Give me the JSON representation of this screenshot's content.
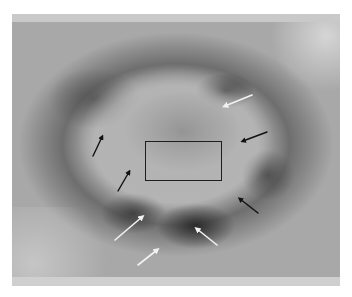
{
  "figure": {
    "type": "grayscale dermoscopic lesion image",
    "colors": {
      "background": "#ffffff",
      "lesion_ring": "#6e6e6e",
      "center": "#b4b4b4",
      "white_arrow": "#f2f2f2",
      "black_arrow": "#111111",
      "box": "#1e1e1e"
    },
    "annotations": {
      "rectangle": {
        "x": 145,
        "y": 141,
        "width": 77,
        "height": 40
      },
      "white_arrows": [
        {
          "from": [
            252,
            95
          ],
          "to": [
            225,
            106
          ]
        },
        {
          "from": [
            115,
            240
          ],
          "to": [
            142,
            217
          ]
        },
        {
          "from": [
            217,
            245
          ],
          "to": [
            197,
            229
          ]
        },
        {
          "from": [
            138,
            265
          ],
          "to": [
            157,
            250
          ]
        }
      ],
      "black_arrows": [
        {
          "from": [
            267,
            132
          ],
          "to": [
            243,
            141
          ]
        },
        {
          "from": [
            93,
            156
          ],
          "to": [
            102,
            137
          ]
        },
        {
          "from": [
            118,
            191
          ],
          "to": [
            129,
            172
          ]
        },
        {
          "from": [
            258,
            213
          ],
          "to": [
            240,
            199
          ]
        }
      ]
    }
  }
}
